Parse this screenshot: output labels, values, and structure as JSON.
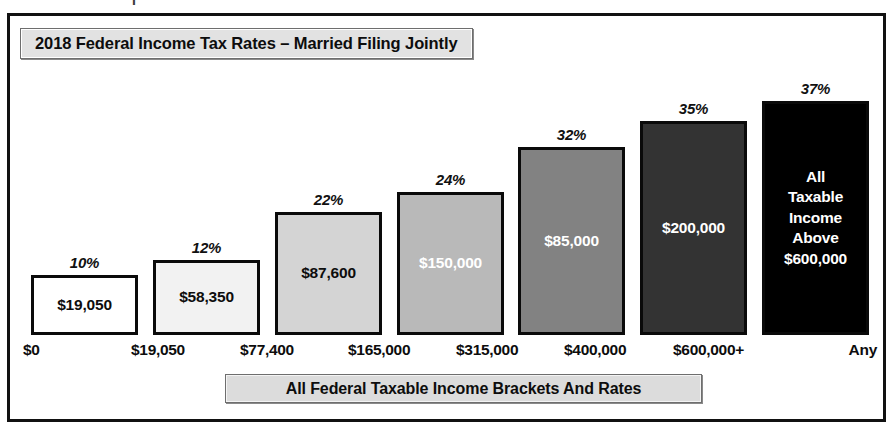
{
  "header": {
    "title": "2018 Federal Income Tax Rates – Married Filing Jointly"
  },
  "footer": {
    "caption": "All Federal Taxable Income Brackets And Rates"
  },
  "artifact": {
    "glyph": "I"
  },
  "chart_data": {
    "type": "bar",
    "title": "2018 Federal Income Tax Rates – Married Filing Jointly",
    "xlabel": "All Federal Taxable Income Brackets And Rates",
    "ylabel": "",
    "grid": false,
    "legend": "none",
    "categories": [
      "10%",
      "12%",
      "22%",
      "24%",
      "32%",
      "35%",
      "37%"
    ],
    "rate_labels": [
      "10%",
      "12%",
      "22%",
      "24%",
      "32%",
      "35%",
      "37%"
    ],
    "values": [
      19050,
      58350,
      87600,
      150000,
      85000,
      200000,
      600000
    ],
    "bar_labels": [
      "$19,050",
      "$58,350",
      "$87,600",
      "$150,000",
      "$85,000",
      "$200,000",
      "All\nTaxable\nIncome\nAbove\n$600,000"
    ],
    "bar_fills": [
      "#ffffff",
      "#f2f2f2",
      "#d4d4d4",
      "#b9b9b9",
      "#828282",
      "#333333",
      "#000000"
    ],
    "bar_text_colors": [
      "#0d0d0d",
      "#0d0d0d",
      "#0d0d0d",
      "#ffffff",
      "#ffffff",
      "#ffffff",
      "#ffffff"
    ],
    "bar_heights_px": [
      60,
      75,
      123,
      143,
      188,
      214,
      234
    ],
    "axis_ticks": [
      "$0",
      "$19,050",
      "$77,400",
      "$165,000",
      "$315,000",
      "$400,000",
      "$600,000+",
      "Any"
    ],
    "bracket_floors": [
      "$0",
      "$19,050",
      "$77,400",
      "$165,000",
      "$315,000",
      "$400,000",
      "$600,000+"
    ],
    "bracket_top": "Any"
  }
}
